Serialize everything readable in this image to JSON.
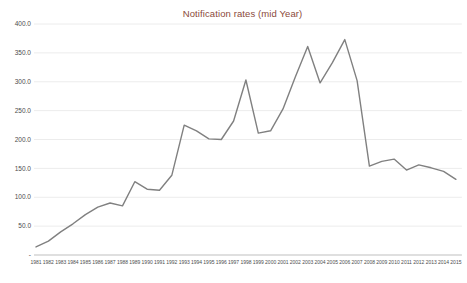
{
  "chart_data": {
    "type": "line",
    "title": "Notification rates (mid Year)",
    "x": [
      1981,
      1982,
      1983,
      1984,
      1985,
      1986,
      1987,
      1988,
      1989,
      1990,
      1991,
      1992,
      1993,
      1994,
      1995,
      1996,
      1997,
      1998,
      1999,
      2000,
      2001,
      2002,
      2003,
      2004,
      2005,
      2006,
      2007,
      2008,
      2009,
      2010,
      2011,
      2012,
      2013,
      2014,
      2015
    ],
    "series": [
      {
        "name": "Notification rates",
        "values": [
          14,
          24,
          40,
          54,
          70,
          83,
          90,
          85,
          127,
          114,
          112,
          138,
          225,
          215,
          201,
          200,
          232,
          303,
          211,
          215,
          253,
          308,
          361,
          298,
          333,
          373,
          302,
          154,
          162,
          166,
          147,
          156,
          151,
          145,
          131
        ]
      }
    ],
    "xlabel": "",
    "ylabel": "",
    "ylim": [
      0,
      400
    ],
    "y_tick_step": 50,
    "y_tick_labels": [
      "-",
      "50.0",
      "100.0",
      "150.0",
      "200.0",
      "250.0",
      "300.0",
      "350.0",
      "400.0"
    ],
    "grid": true,
    "legend": "none",
    "colors": {
      "line": "#808080",
      "title": "#8b4a3a",
      "gridline": "#ececec",
      "axis_line": "#bfbfbf",
      "tick_label": "#4d4d4d"
    }
  }
}
